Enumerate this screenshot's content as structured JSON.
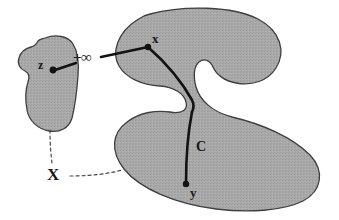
{
  "figure": {
    "background_color": "#ffffff",
    "region_fill": "#a9a9a9",
    "region_stroke": "#3c3c3c",
    "path_color": "#111111",
    "dash_color": "#555555"
  },
  "labels": {
    "point_x": "x",
    "point_y": "y",
    "point_z": "z",
    "path_c": "C",
    "infinity": "+∞",
    "set_x": "X"
  },
  "points": {
    "x": {
      "label": "x",
      "cx": 148,
      "cy": 47
    },
    "y": {
      "label": "y",
      "cx": 186,
      "cy": 184
    },
    "z": {
      "label": "z",
      "cx": 53,
      "cy": 70
    }
  },
  "annotations": [
    {
      "name": "infinite-distance",
      "text": "+∞",
      "meaning": "distance from z to x is infinite"
    },
    {
      "name": "geodesic-path",
      "text": "C",
      "meaning": "geodesic curve joining x and y inside X"
    },
    {
      "name": "set-name",
      "text": "X",
      "meaning": "the shaded set X (two components)"
    }
  ]
}
